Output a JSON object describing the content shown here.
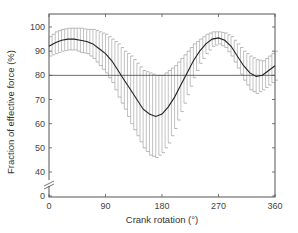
{
  "chart_data": {
    "type": "line",
    "title": "",
    "xlabel": "Crank rotation (°)",
    "ylabel": "Fraction of effective force (%)",
    "xlim": [
      0,
      360
    ],
    "ylim": [
      0,
      105
    ],
    "axis_break": "y-axis broken between 0 and 40",
    "xticks": [
      0,
      90,
      180,
      270,
      360
    ],
    "yticks": [
      0,
      40,
      50,
      60,
      70,
      80,
      90,
      100
    ],
    "reference_line": {
      "y": 80,
      "style": "solid horizontal"
    },
    "grid": false,
    "legend": null,
    "series": [
      {
        "name": "mean ± SD",
        "x": [
          0,
          10,
          20,
          30,
          40,
          50,
          60,
          70,
          80,
          90,
          100,
          110,
          120,
          130,
          140,
          150,
          160,
          170,
          180,
          190,
          200,
          210,
          220,
          230,
          240,
          250,
          260,
          270,
          280,
          290,
          300,
          310,
          320,
          330,
          340,
          350,
          360
        ],
        "mean": [
          92,
          93.5,
          94.5,
          95,
          95,
          94.5,
          94,
          93,
          91,
          89,
          86,
          82,
          78,
          74,
          70,
          66,
          64,
          63,
          64,
          67,
          71,
          76,
          81,
          86,
          90,
          93,
          95,
          95.5,
          94.5,
          92,
          88,
          84,
          81,
          79.5,
          80,
          82,
          84
        ],
        "sd": [
          4,
          4.5,
          4.5,
          4.5,
          4.5,
          5,
          5,
          6,
          7,
          8,
          9,
          11,
          12,
          14,
          15,
          16,
          17,
          17,
          16,
          15,
          13,
          11,
          9,
          7,
          5,
          4,
          3,
          2.5,
          3,
          4,
          5,
          6,
          7,
          7,
          6,
          6,
          6
        ]
      }
    ]
  }
}
